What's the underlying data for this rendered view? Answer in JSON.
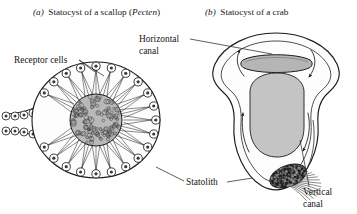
{
  "figure": {
    "kind": "scientific-line-diagram",
    "background_color": "#ffffff",
    "ink_color": "#1b1b1b",
    "panels": [
      {
        "id": "a",
        "letter": "(a)",
        "title_text": "Statocyst of a scallop (",
        "title_species": "Pecten",
        "title_tail": ")",
        "full_title": "(a) Statocyst of a scallop (Pecten)",
        "subject": "scallop-statocyst",
        "labels": [
          {
            "id": "receptor-cells",
            "text": "Receptor cells",
            "lines": [
              "Receptor cells"
            ],
            "leader": "two-branch"
          },
          {
            "id": "statolith-a",
            "text": "Statolith",
            "lines": [
              "Statolith"
            ],
            "leader": "single-line-up-left"
          }
        ],
        "structures": {
          "outer_wall": "ellipse",
          "receptor_cell_count": 24,
          "statolith_fill": "#b9b9b9",
          "statolith_style": "stippled-granular",
          "neck": "two-rowed cell stalk exiting left",
          "neck_cell_rows": 2,
          "cilia_per_cell": 3
        }
      },
      {
        "id": "b",
        "letter": "(b)",
        "title_text": "Statocyst of a crab",
        "full_title": "(b) Statocyst of a crab",
        "subject": "crab-statocyst",
        "labels": [
          {
            "id": "horizontal-canal",
            "text": "Horizontal canal",
            "lines": [
              "Horizontal",
              "canal"
            ],
            "leader": "single-line-right"
          },
          {
            "id": "statolith-b",
            "text": "Statolith",
            "lines": [
              "Statolith"
            ],
            "leader": "single-line-right"
          },
          {
            "id": "vertical-canal",
            "text": "Vertical canal",
            "lines": [
              "Vertical",
              "canal"
            ],
            "leader": "single-line-up-left"
          }
        ],
        "structures": {
          "outer_wall": "bell-shield-outline",
          "inner_sac_fill": "#c4c4c4",
          "horizontal_canal_fill": "#b5b5b5",
          "statolith_fill": "#4a4a4a",
          "statolith_style": "dense-stippled",
          "sensory_hair_count": 13,
          "flow_arrow_count": 4,
          "flow_arrows": [
            {
              "id": "arrow-top-left",
              "direction": "up-left"
            },
            {
              "id": "arrow-top-right",
              "direction": "down-right"
            },
            {
              "id": "arrow-lower-left",
              "direction": "up"
            },
            {
              "id": "arrow-lower-right",
              "direction": "down-right"
            }
          ]
        }
      }
    ]
  }
}
